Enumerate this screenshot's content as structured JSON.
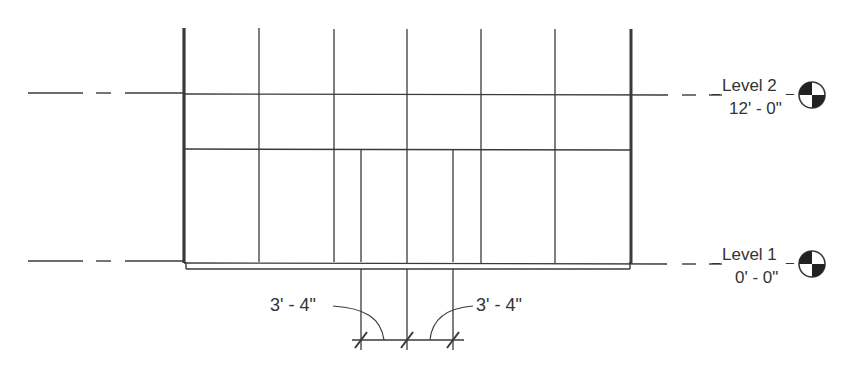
{
  "drawing": {
    "type": "curtain wall elevation",
    "line_color": "#3a3a3a",
    "background": "#ffffff"
  },
  "levels": [
    {
      "name": "Level 2",
      "elevation": "12' - 0\"",
      "y": 94,
      "icon": "level-head-icon"
    },
    {
      "name": "Level 1",
      "elevation": "0' - 0\"",
      "y": 264,
      "icon": "level-head-icon"
    }
  ],
  "dimensions": [
    {
      "value": "3' - 4\"",
      "side": "left"
    },
    {
      "value": "3' - 4\"",
      "side": "right"
    }
  ]
}
